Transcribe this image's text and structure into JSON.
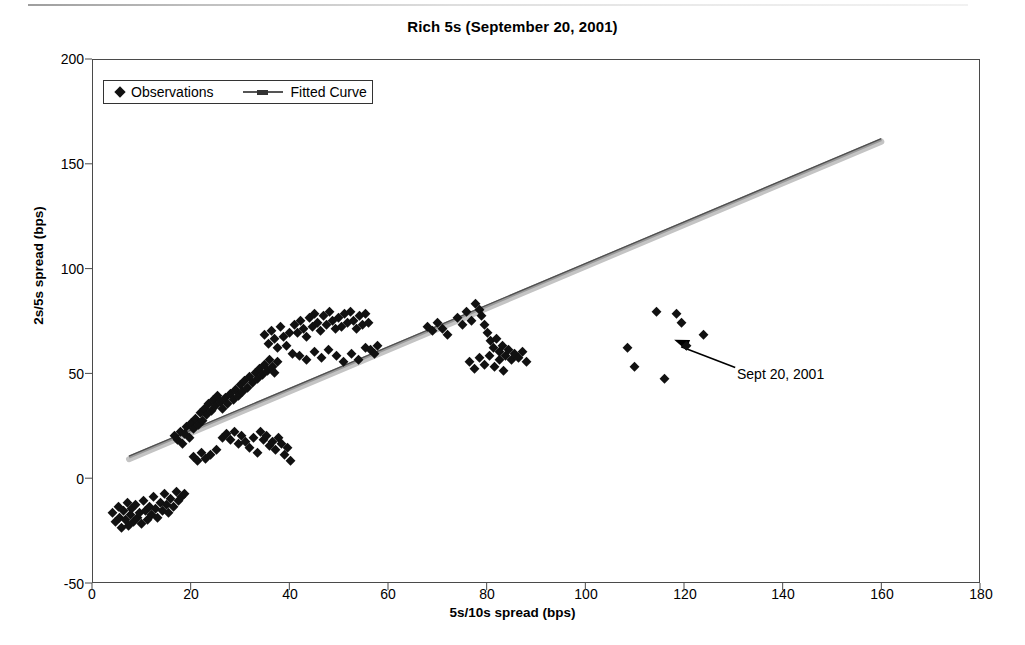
{
  "chart_data": {
    "type": "scatter",
    "title": "Rich 5s (September 20, 2001)",
    "xlabel": "5s/10s spread (bps)",
    "ylabel": "2s/5s spread (bps)",
    "xlim": [
      0,
      180
    ],
    "ylim": [
      -50,
      200
    ],
    "xticks": [
      0,
      20,
      40,
      60,
      80,
      100,
      120,
      140,
      160,
      180
    ],
    "yticks": [
      -50,
      0,
      50,
      100,
      150,
      200
    ],
    "grid": false,
    "legend_position": "top-left",
    "legend": [
      {
        "label": "Observations",
        "marker": "diamond",
        "color": "#111111"
      },
      {
        "label": "Fitted Curve",
        "marker": "line",
        "color": "#555555"
      }
    ],
    "annotations": [
      {
        "text": "Sept 20, 2001",
        "x": 132,
        "y": 50,
        "arrow_to_x": 118,
        "arrow_to_y": 66
      }
    ],
    "series": [
      {
        "name": "Observations",
        "marker": "diamond",
        "color": "#111111",
        "points": [
          [
            4.2,
            -17
          ],
          [
            4.8,
            -21
          ],
          [
            5.3,
            -14
          ],
          [
            5.6,
            -19
          ],
          [
            6.0,
            -24
          ],
          [
            6.3,
            -16
          ],
          [
            6.8,
            -20
          ],
          [
            7.1,
            -12
          ],
          [
            7.4,
            -23
          ],
          [
            7.8,
            -18
          ],
          [
            8.1,
            -15
          ],
          [
            8.5,
            -21
          ],
          [
            8.9,
            -13
          ],
          [
            9.2,
            -19
          ],
          [
            9.6,
            -17
          ],
          [
            10.0,
            -22
          ],
          [
            10.4,
            -11
          ],
          [
            10.8,
            -16
          ],
          [
            11.2,
            -20
          ],
          [
            11.6,
            -14
          ],
          [
            12.0,
            -18
          ],
          [
            12.5,
            -9
          ],
          [
            12.9,
            -15
          ],
          [
            13.3,
            -19
          ],
          [
            13.8,
            -12
          ],
          [
            14.2,
            -16
          ],
          [
            14.7,
            -8
          ],
          [
            15.1,
            -13
          ],
          [
            15.6,
            -17
          ],
          [
            16.0,
            -10
          ],
          [
            16.6,
            -14
          ],
          [
            17.1,
            -7
          ],
          [
            17.6,
            -11
          ],
          [
            18.2,
            -9
          ],
          [
            18.8,
            -8
          ],
          [
            16.8,
            20
          ],
          [
            17.4,
            18
          ],
          [
            17.9,
            22
          ],
          [
            18.3,
            16
          ],
          [
            18.8,
            21
          ],
          [
            19.2,
            24
          ],
          [
            19.7,
            19
          ],
          [
            20.1,
            26
          ],
          [
            20.6,
            23
          ],
          [
            21.0,
            28
          ],
          [
            21.5,
            25
          ],
          [
            21.9,
            31
          ],
          [
            22.4,
            27
          ],
          [
            22.8,
            33
          ],
          [
            23.3,
            30
          ],
          [
            23.7,
            35
          ],
          [
            24.2,
            32
          ],
          [
            24.6,
            37
          ],
          [
            25.1,
            34
          ],
          [
            25.5,
            39
          ],
          [
            20.5,
            10
          ],
          [
            21.4,
            8
          ],
          [
            22.2,
            12
          ],
          [
            23.0,
            9
          ],
          [
            24.0,
            11
          ],
          [
            25.2,
            13
          ],
          [
            26.0,
            36
          ],
          [
            26.5,
            33
          ],
          [
            27.0,
            38
          ],
          [
            27.5,
            35
          ],
          [
            28.0,
            40
          ],
          [
            28.6,
            37
          ],
          [
            29.1,
            42
          ],
          [
            29.6,
            39
          ],
          [
            30.0,
            44
          ],
          [
            30.5,
            41
          ],
          [
            31.0,
            46
          ],
          [
            31.6,
            43
          ],
          [
            32.0,
            48
          ],
          [
            32.6,
            45
          ],
          [
            33.1,
            50
          ],
          [
            33.6,
            47
          ],
          [
            34.0,
            52
          ],
          [
            34.6,
            49
          ],
          [
            35.0,
            54
          ],
          [
            35.5,
            51
          ],
          [
            36.0,
            56
          ],
          [
            36.5,
            53
          ],
          [
            37.0,
            50
          ],
          [
            37.6,
            55
          ],
          [
            26.5,
            19
          ],
          [
            27.3,
            21
          ],
          [
            28.1,
            18
          ],
          [
            28.9,
            22
          ],
          [
            29.6,
            16
          ],
          [
            30.4,
            20
          ],
          [
            31.2,
            17
          ],
          [
            32.0,
            14
          ],
          [
            32.8,
            19
          ],
          [
            33.5,
            12
          ],
          [
            34.2,
            22
          ],
          [
            34.8,
            18
          ],
          [
            35.4,
            20
          ],
          [
            36.0,
            15
          ],
          [
            36.6,
            17
          ],
          [
            37.2,
            13
          ],
          [
            37.8,
            19
          ],
          [
            38.4,
            16
          ],
          [
            39.0,
            11
          ],
          [
            39.6,
            14
          ],
          [
            40.2,
            8
          ],
          [
            35.0,
            68
          ],
          [
            35.8,
            64
          ],
          [
            36.4,
            70
          ],
          [
            37.0,
            66
          ],
          [
            37.6,
            62
          ],
          [
            38.2,
            72
          ],
          [
            38.8,
            67
          ],
          [
            39.4,
            63
          ],
          [
            40.0,
            69
          ],
          [
            40.6,
            59
          ],
          [
            41.0,
            73
          ],
          [
            41.6,
            69
          ],
          [
            42.2,
            75
          ],
          [
            42.8,
            71
          ],
          [
            43.4,
            67
          ],
          [
            44.0,
            76
          ],
          [
            44.6,
            72
          ],
          [
            45.2,
            78
          ],
          [
            45.8,
            74
          ],
          [
            46.4,
            70
          ],
          [
            47.0,
            77
          ],
          [
            47.6,
            73
          ],
          [
            48.2,
            79
          ],
          [
            48.8,
            75
          ],
          [
            49.4,
            71
          ],
          [
            50.0,
            76
          ],
          [
            50.6,
            72
          ],
          [
            51.2,
            78
          ],
          [
            51.8,
            74
          ],
          [
            52.4,
            79
          ],
          [
            53.0,
            75
          ],
          [
            53.6,
            71
          ],
          [
            54.2,
            77
          ],
          [
            54.8,
            73
          ],
          [
            55.4,
            78
          ],
          [
            56.0,
            74
          ],
          [
            42.0,
            58
          ],
          [
            43.5,
            56
          ],
          [
            45.0,
            60
          ],
          [
            46.5,
            57
          ],
          [
            48.0,
            61
          ],
          [
            49.5,
            58
          ],
          [
            51.0,
            55
          ],
          [
            52.5,
            59
          ],
          [
            54.0,
            56
          ],
          [
            55.5,
            62
          ],
          [
            56.5,
            61
          ],
          [
            57.2,
            59
          ],
          [
            57.9,
            63
          ],
          [
            68.0,
            72
          ],
          [
            69.0,
            70
          ],
          [
            70.0,
            74
          ],
          [
            71.0,
            71
          ],
          [
            72.0,
            68
          ],
          [
            74.0,
            76
          ],
          [
            75.0,
            73
          ],
          [
            76.0,
            79
          ],
          [
            77.0,
            75
          ],
          [
            77.8,
            83
          ],
          [
            78.5,
            80
          ],
          [
            79.0,
            77
          ],
          [
            79.6,
            73
          ],
          [
            80.2,
            69
          ],
          [
            80.8,
            65
          ],
          [
            81.4,
            62
          ],
          [
            82.0,
            66
          ],
          [
            82.6,
            60
          ],
          [
            83.2,
            63
          ],
          [
            83.8,
            58
          ],
          [
            84.4,
            61
          ],
          [
            85.0,
            56
          ],
          [
            85.6,
            59
          ],
          [
            86.4,
            57
          ],
          [
            87.2,
            60
          ],
          [
            88.0,
            55
          ],
          [
            76.5,
            55
          ],
          [
            77.5,
            52
          ],
          [
            78.5,
            57
          ],
          [
            79.5,
            54
          ],
          [
            80.5,
            58
          ],
          [
            81.5,
            53
          ],
          [
            82.5,
            56
          ],
          [
            83.5,
            51
          ],
          [
            108.5,
            62
          ],
          [
            110.0,
            53
          ],
          [
            116.0,
            47
          ],
          [
            114.5,
            79
          ],
          [
            118.5,
            78
          ],
          [
            119.5,
            74
          ],
          [
            120.5,
            63
          ],
          [
            124.0,
            68
          ]
        ]
      },
      {
        "name": "Fitted Curve",
        "type": "line",
        "color": "#6d6d6d",
        "points": [
          [
            7.5,
            10.5
          ],
          [
            160.0,
            162.0
          ]
        ]
      }
    ]
  }
}
